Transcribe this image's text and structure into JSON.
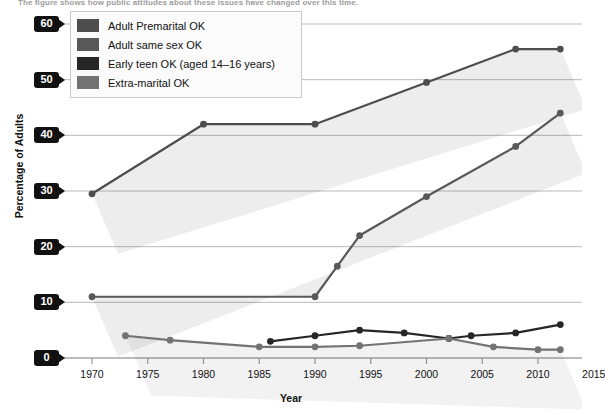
{
  "caption": "The figure shows how public attitudes about these issues have changed over this time.",
  "chart_data": {
    "type": "line",
    "title": "",
    "xlabel": "Year",
    "ylabel": "Percentage of Adults",
    "xlim": [
      1968,
      2016
    ],
    "ylim": [
      0,
      60
    ],
    "xticks": [
      1970,
      1975,
      1980,
      1985,
      1990,
      1995,
      2000,
      2005,
      2010,
      2015
    ],
    "yticks": [
      0,
      10,
      20,
      30,
      40,
      50,
      60
    ],
    "grid": "horizontal",
    "legend_position": "top-left",
    "series": [
      {
        "name": "Adult Premarital OK",
        "color": "#4d4d4d",
        "x": [
          1970,
          1980,
          1990,
          2000,
          2008,
          2012
        ],
        "values": [
          29.5,
          42,
          42,
          49.5,
          55.5,
          55.5
        ]
      },
      {
        "name": "Adult same sex OK",
        "color": "#595959",
        "x": [
          1970,
          1990,
          1992,
          1994,
          2000,
          2008,
          2012
        ],
        "values": [
          11,
          11,
          16.5,
          22,
          29,
          38,
          44
        ]
      },
      {
        "name": "Early teen OK (aged 14–16 years)",
        "color": "#262626",
        "x": [
          1986,
          1990,
          1994,
          1998,
          2002,
          2004,
          2008,
          2012
        ],
        "values": [
          3,
          4,
          5,
          4.5,
          3.5,
          4,
          4.5,
          6
        ]
      },
      {
        "name": "Extra-marital  OK",
        "color": "#737373",
        "x": [
          1973,
          1977,
          1985,
          1990,
          1994,
          2002,
          2006,
          2010,
          2012
        ],
        "values": [
          4,
          3.2,
          2,
          2,
          2.2,
          3.5,
          2,
          1.5,
          1.5
        ]
      }
    ]
  },
  "legend": {
    "items": [
      {
        "label": "Adult Premarital OK",
        "color": "#4d4d4d"
      },
      {
        "label": "Adult same sex OK",
        "color": "#595959"
      },
      {
        "label": "Early teen OK (aged 14–16 years)",
        "color": "#262626"
      },
      {
        "label": "Extra-marital  OK",
        "color": "#737373"
      }
    ]
  }
}
